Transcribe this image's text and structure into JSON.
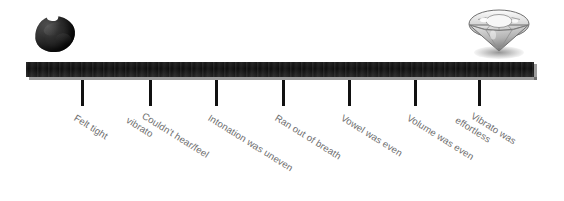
{
  "diagram": {
    "background_color": "#ffffff",
    "bar_color": "#0d0d0d",
    "tick_color": "#111111",
    "label_color": "#6e6e6e",
    "left_endpoint_icon": "coal-lump-icon",
    "right_endpoint_icon": "diamond-icon",
    "label_rotation_degrees": 32
  },
  "ticks": [
    {
      "x": 81,
      "label_line1": "Felt tight",
      "label_line2": ""
    },
    {
      "x": 149,
      "label_line1": "Couldn't hear/feel",
      "label_line2": "vibrato"
    },
    {
      "x": 215,
      "label_line1": "Intonation was uneven",
      "label_line2": ""
    },
    {
      "x": 282,
      "label_line1": "Ran out of breath",
      "label_line2": ""
    },
    {
      "x": 348,
      "label_line1": "Vowel was even",
      "label_line2": ""
    },
    {
      "x": 414,
      "label_line1": "Volume was even",
      "label_line2": ""
    },
    {
      "x": 478,
      "label_line1": "Vibrato was",
      "label_line2": "effortless"
    }
  ]
}
